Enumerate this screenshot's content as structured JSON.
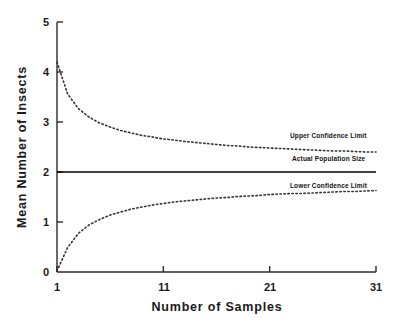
{
  "chart_data": {
    "type": "line",
    "title": "",
    "subtitle": "",
    "xlabel": "Number of Samples",
    "ylabel": "Mean Number of Insects",
    "xlim": [
      1,
      31
    ],
    "ylim": [
      0,
      5
    ],
    "xticks": [
      "1",
      "11",
      "21",
      "31"
    ],
    "xtick_values": [
      1,
      11,
      21,
      31
    ],
    "yticks": [
      "0",
      "1",
      "2",
      "3",
      "4",
      "5"
    ],
    "ytick_values": [
      0,
      1,
      2,
      3,
      4,
      5
    ],
    "grid": false,
    "legend_position": "inline-right-annotations",
    "x": [
      1,
      2,
      3,
      4,
      5,
      6,
      7,
      8,
      9,
      10,
      11,
      12,
      13,
      14,
      15,
      16,
      17,
      18,
      19,
      20,
      21,
      22,
      23,
      24,
      25,
      26,
      27,
      28,
      29,
      30,
      31
    ],
    "series": [
      {
        "name": "Upper Confidence Limit",
        "style": "dotted",
        "color": "#333333",
        "values": [
          4.2,
          3.56,
          3.27,
          3.1,
          2.98,
          2.9,
          2.83,
          2.78,
          2.73,
          2.7,
          2.66,
          2.64,
          2.61,
          2.59,
          2.57,
          2.55,
          2.53,
          2.52,
          2.5,
          2.49,
          2.48,
          2.47,
          2.46,
          2.45,
          2.44,
          2.43,
          2.42,
          2.42,
          2.41,
          2.4,
          2.4
        ]
      },
      {
        "name": "Actual Population Size",
        "style": "solid",
        "color": "#000000",
        "values": [
          2,
          2,
          2,
          2,
          2,
          2,
          2,
          2,
          2,
          2,
          2,
          2,
          2,
          2,
          2,
          2,
          2,
          2,
          2,
          2,
          2,
          2,
          2,
          2,
          2,
          2,
          2,
          2,
          2,
          2,
          2
        ]
      },
      {
        "name": "Lower Confidence Limit",
        "style": "dotted",
        "color": "#333333",
        "values": [
          0.02,
          0.49,
          0.77,
          0.94,
          1.05,
          1.14,
          1.2,
          1.26,
          1.3,
          1.34,
          1.37,
          1.4,
          1.42,
          1.44,
          1.46,
          1.48,
          1.49,
          1.51,
          1.52,
          1.53,
          1.55,
          1.56,
          1.57,
          1.57,
          1.58,
          1.59,
          1.6,
          1.61,
          1.61,
          1.62,
          1.63
        ]
      }
    ],
    "annotations": [
      {
        "text": "Upper Confidence Limit",
        "x": 31,
        "y": 2.62
      },
      {
        "text": "Actual Population Size",
        "x": 31,
        "y": 2.18
      },
      {
        "text": "Lower Confidence Limit",
        "x": 31,
        "y": 1.75
      }
    ]
  }
}
